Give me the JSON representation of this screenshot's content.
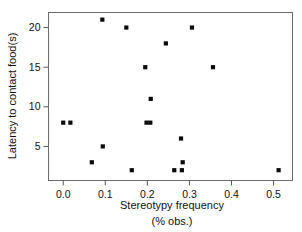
{
  "chart_data": {
    "type": "scatter",
    "title": "",
    "xlabel": "Stereotypy frequency",
    "xlabel_line2": "(% obs.)",
    "ylabel": "Latency to contact food(s)",
    "xlim": [
      -0.035,
      0.545
    ],
    "ylim": [
      0.7,
      21.9
    ],
    "xticks": [
      0.0,
      0.1,
      0.2,
      0.3,
      0.4,
      0.5
    ],
    "xticklabels": [
      "0.0",
      "0.1",
      "0.2",
      "0.3",
      "0.4",
      "0.5"
    ],
    "yticks": [
      5,
      10,
      15,
      20
    ],
    "yticklabels": [
      "5",
      "10",
      "15",
      "20"
    ],
    "grid": false,
    "legend": null,
    "marker": "square",
    "marker_color": "#0b0b0b",
    "points": [
      {
        "x": 0.0,
        "y": 8
      },
      {
        "x": 0.017,
        "y": 8
      },
      {
        "x": 0.068,
        "y": 3
      },
      {
        "x": 0.093,
        "y": 21
      },
      {
        "x": 0.094,
        "y": 5
      },
      {
        "x": 0.15,
        "y": 20
      },
      {
        "x": 0.163,
        "y": 2
      },
      {
        "x": 0.195,
        "y": 15
      },
      {
        "x": 0.198,
        "y": 8
      },
      {
        "x": 0.207,
        "y": 8
      },
      {
        "x": 0.208,
        "y": 11
      },
      {
        "x": 0.244,
        "y": 18
      },
      {
        "x": 0.264,
        "y": 2
      },
      {
        "x": 0.28,
        "y": 6
      },
      {
        "x": 0.282,
        "y": 2
      },
      {
        "x": 0.284,
        "y": 3
      },
      {
        "x": 0.306,
        "y": 20
      },
      {
        "x": 0.356,
        "y": 15
      },
      {
        "x": 0.512,
        "y": 2
      }
    ],
    "n_points": 19
  },
  "axes": {
    "y_axis_title": "Latency to contact food(s)",
    "x_axis_title": "Stereotypy frequency",
    "x_axis_subtitle": "(% obs.)"
  }
}
